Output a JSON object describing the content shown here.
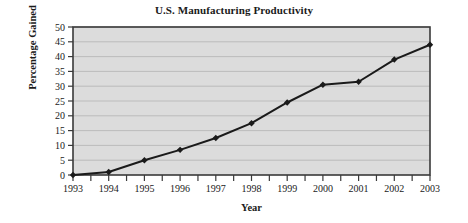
{
  "chart_data": {
    "type": "line",
    "title": "U.S. Manufacturing Productivity",
    "xlabel": "Year",
    "ylabel": "Percentage Gained",
    "categories": [
      "1993",
      "1994",
      "1995",
      "1996",
      "1997",
      "1998",
      "1999",
      "2000",
      "2001",
      "2002",
      "2003"
    ],
    "values": [
      0,
      1,
      5,
      8.5,
      12.5,
      17.5,
      24.5,
      30.5,
      31.5,
      39,
      44
    ],
    "series": [
      {
        "name": "Percentage Gained",
        "values": [
          0,
          1,
          5,
          8.5,
          12.5,
          17.5,
          24.5,
          30.5,
          31.5,
          39,
          44
        ]
      }
    ],
    "ylim": [
      0,
      50
    ],
    "yticks": [
      "0",
      "5",
      "10",
      "15",
      "20",
      "25",
      "30",
      "35",
      "40",
      "45",
      "50"
    ],
    "ytick_values": [
      0,
      5,
      10,
      15,
      20,
      25,
      30,
      35,
      40,
      45,
      50
    ],
    "xticks": [
      "1993",
      "1994",
      "1995",
      "1996",
      "1997",
      "1998",
      "1999",
      "2000",
      "2001",
      "2002",
      "2003"
    ],
    "grid": true,
    "grid_axis": "y",
    "legend": false,
    "legend_position": "none",
    "marker": "diamond",
    "colors": {
      "plot_background": "#dcdcdc",
      "line": "#1a1a1a",
      "marker": "#1a1a1a",
      "gridline": "#b4b4b4",
      "axis": "#3a3a3a",
      "text": "#1a1a1a",
      "figure_background": "#ffffff"
    }
  }
}
